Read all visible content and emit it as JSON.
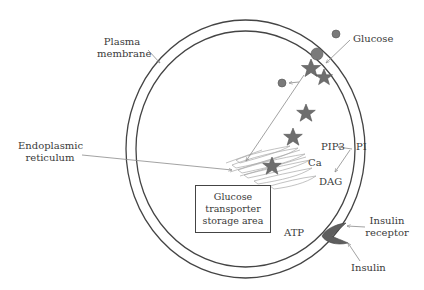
{
  "diagram": {
    "type": "cell-signaling-schematic",
    "labels": {
      "plasma_membrane_line1": "Plasma",
      "plasma_membrane_line2": "membrane",
      "glucose": "Glucose",
      "endoplasmic_line1": "Endoplasmic",
      "endoplasmic_line2": "reticulum",
      "pip3": "PIP3",
      "pi": "PI",
      "ca": "Ca",
      "dag": "DAG",
      "atp": "ATP",
      "insulin_receptor_line1": "Insulin",
      "insulin_receptor_line2": "receptor",
      "insulin": "Insulin"
    },
    "storage_box": {
      "line1": "Glucose",
      "line2": "transporter",
      "line3": "storage area"
    },
    "colors": {
      "membrane": "#444444",
      "star_fill": "#6e6e6e",
      "glucose_fill": "#7a7a7a",
      "arrow": "#8a8a8a",
      "receptor_fill": "#5e5e5e",
      "text": "#3a3a3a"
    }
  }
}
